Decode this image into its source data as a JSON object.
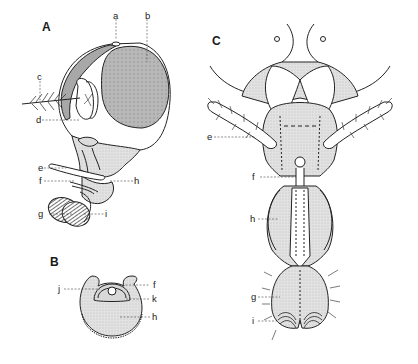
{
  "figure": {
    "panels": [
      {
        "id": "A",
        "label": "A",
        "view": "lateral view of head with proboscis",
        "callouts": [
          "a",
          "b",
          "c",
          "d",
          "e",
          "f",
          "g",
          "h",
          "i"
        ]
      },
      {
        "id": "B",
        "label": "B",
        "view": "cross-section of proboscis",
        "callouts": [
          "j",
          "f",
          "k",
          "h"
        ]
      },
      {
        "id": "C",
        "label": "C",
        "view": "ventral/frontal view of head and proboscis",
        "callouts": [
          "e",
          "f",
          "h",
          "g",
          "i"
        ]
      }
    ],
    "labels": {
      "A": "A",
      "B": "B",
      "C": "C",
      "a": "a",
      "b": "b",
      "c": "c",
      "d": "d",
      "e": "e",
      "f": "f",
      "g": "g",
      "h": "h",
      "i": "i",
      "j": "j",
      "k": "k"
    },
    "colors": {
      "line": "#222222",
      "stipple": "#cfcfcf",
      "eye": "#bdbdbd",
      "background": "#ffffff"
    }
  }
}
